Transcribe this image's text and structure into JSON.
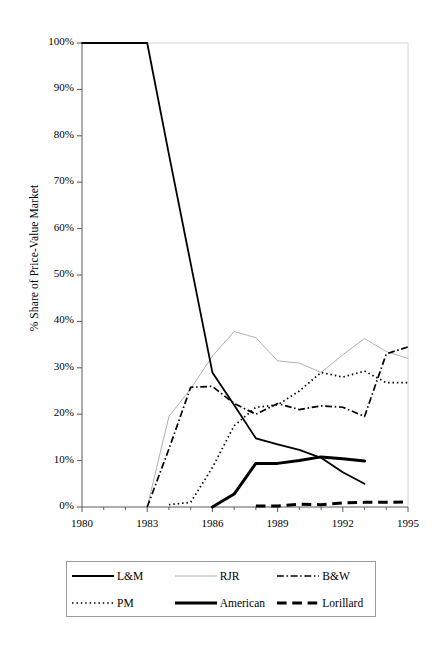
{
  "chart_data": {
    "type": "line",
    "title": "",
    "subtitle": "",
    "xlabel": "",
    "ylabel": "% Share of Price-Value Market",
    "xlim": [
      1980,
      1995
    ],
    "ylim": [
      0,
      100
    ],
    "grid": false,
    "legend_position": "bottom",
    "x_tick_labels": [
      "1980",
      "1983",
      "1986",
      "1989",
      "1992",
      "1995"
    ],
    "x_tick_values": [
      1980,
      1983,
      1986,
      1989,
      1992,
      1995
    ],
    "x_minor_ticks": [
      1981,
      1982,
      1984,
      1985,
      1987,
      1988,
      1990,
      1991,
      1993,
      1994
    ],
    "y_tick_labels": [
      "0%",
      "10%",
      "20%",
      "30%",
      "40%",
      "50%",
      "60%",
      "70%",
      "80%",
      "90%",
      "100%"
    ],
    "y_tick_values": [
      0,
      10,
      20,
      30,
      40,
      50,
      60,
      70,
      80,
      90,
      100
    ],
    "x": [
      1980,
      1981,
      1982,
      1983,
      1984,
      1985,
      1986,
      1987,
      1988,
      1989,
      1990,
      1991,
      1992,
      1993,
      1994,
      1995
    ],
    "series": [
      {
        "name": "L&M",
        "style": "solid",
        "width": 1.8,
        "color": "#000000",
        "x": [
          1980,
          1981,
          1982,
          1983,
          1984,
          1985,
          1986,
          1987,
          1988,
          1989,
          1990,
          1991,
          1992,
          1993
        ],
        "values": [
          100,
          100,
          100,
          100,
          76,
          52.5,
          29,
          22,
          14.8,
          13.5,
          12.3,
          10.6,
          7.5,
          5.0
        ]
      },
      {
        "name": "RJR",
        "style": "solid",
        "width": 0.8,
        "color": "#9c9c9c",
        "x": [
          1983,
          1984,
          1985,
          1986,
          1987,
          1988,
          1989,
          1990,
          1991,
          1992,
          1993,
          1994,
          1995
        ],
        "values": [
          0,
          19.5,
          25.5,
          32.5,
          37.8,
          36.5,
          31.5,
          31.0,
          29.0,
          32.8,
          36.3,
          33.5,
          32.0
        ]
      },
      {
        "name": "B&W",
        "style": "dashdot",
        "width": 1.7,
        "color": "#000000",
        "x": [
          1983,
          1984,
          1985,
          1986,
          1987,
          1988,
          1989,
          1990,
          1991,
          1992,
          1993,
          1994,
          1995
        ],
        "values": [
          0,
          12.5,
          25.8,
          26.0,
          22.3,
          20.0,
          22.3,
          21.0,
          21.8,
          21.5,
          19.5,
          33.0,
          34.5
        ]
      },
      {
        "name": "PM",
        "style": "dotted",
        "width": 1.7,
        "color": "#000000",
        "x": [
          1984,
          1985,
          1986,
          1987,
          1988,
          1989,
          1990,
          1991,
          1992,
          1993,
          1994,
          1995
        ],
        "values": [
          0.5,
          1.0,
          8.5,
          17.5,
          21.5,
          22.0,
          25.0,
          29.0,
          28.0,
          29.3,
          26.8,
          26.8
        ]
      },
      {
        "name": "American",
        "style": "solid",
        "width": 3.0,
        "color": "#000000",
        "x": [
          1986,
          1987,
          1988,
          1989,
          1990,
          1991,
          1992,
          1993
        ],
        "values": [
          0,
          2.8,
          9.4,
          9.4,
          10.0,
          10.8,
          10.4,
          9.9
        ]
      },
      {
        "name": "Lorillard",
        "style": "dashed",
        "width": 3.0,
        "color": "#000000",
        "x": [
          1988,
          1989,
          1990,
          1991,
          1992,
          1993,
          1994,
          1995
        ],
        "values": [
          0.2,
          0.2,
          0.6,
          0.5,
          0.9,
          1.0,
          1.0,
          1.1
        ]
      }
    ]
  },
  "axes": {
    "y_title": "% Share of Price-Value Market",
    "y_ticks": [
      {
        "label": "100%"
      },
      {
        "label": "90%"
      },
      {
        "label": "80%"
      },
      {
        "label": "70%"
      },
      {
        "label": "60%"
      },
      {
        "label": "50%"
      },
      {
        "label": "40%"
      },
      {
        "label": "30%"
      },
      {
        "label": "20%"
      },
      {
        "label": "10%"
      },
      {
        "label": "0%"
      }
    ],
    "x_ticks": [
      {
        "label": "1980"
      },
      {
        "label": "1983"
      },
      {
        "label": "1986"
      },
      {
        "label": "1989"
      },
      {
        "label": "1992"
      },
      {
        "label": "1995"
      }
    ]
  },
  "legend": {
    "entries": [
      {
        "label": "L&M",
        "style": "solid",
        "width": 1.8,
        "color": "#000000"
      },
      {
        "label": "RJR",
        "style": "solid",
        "width": 0.8,
        "color": "#9c9c9c"
      },
      {
        "label": "B&W",
        "style": "dashdot",
        "width": 1.7,
        "color": "#000000"
      },
      {
        "label": "PM",
        "style": "dotted",
        "width": 1.7,
        "color": "#000000"
      },
      {
        "label": "American",
        "style": "solid",
        "width": 3.0,
        "color": "#000000"
      },
      {
        "label": "Lorillard",
        "style": "dashed",
        "width": 3.0,
        "color": "#000000"
      }
    ]
  }
}
